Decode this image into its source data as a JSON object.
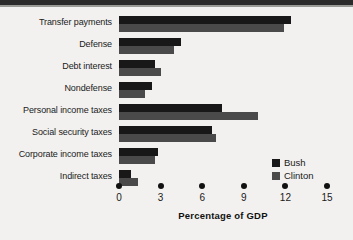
{
  "chart_data": {
    "type": "bar",
    "orientation": "horizontal",
    "title": "",
    "xlabel": "Percentage of GDP",
    "ylabel": "",
    "xlim": [
      0,
      15
    ],
    "xticks": [
      0,
      3,
      6,
      9,
      12,
      15
    ],
    "xtick_labels": [
      "0",
      "3",
      "6",
      "9",
      "12",
      "15"
    ],
    "grid": false,
    "legend_position": "lower-right",
    "categories": [
      "Transfer payments",
      "Defense",
      "Debt interest",
      "Nondefense",
      "Personal income taxes",
      "Social security taxes",
      "Corporate income taxes",
      "Indirect taxes"
    ],
    "series": [
      {
        "name": "Bush",
        "color": "#181818",
        "values": [
          12.4,
          4.5,
          2.6,
          2.4,
          7.4,
          6.7,
          2.8,
          0.9
        ]
      },
      {
        "name": "Clinton",
        "color": "#4a4a4a",
        "values": [
          11.9,
          4.0,
          3.0,
          1.9,
          10.0,
          7.0,
          2.6,
          1.4
        ]
      }
    ]
  }
}
